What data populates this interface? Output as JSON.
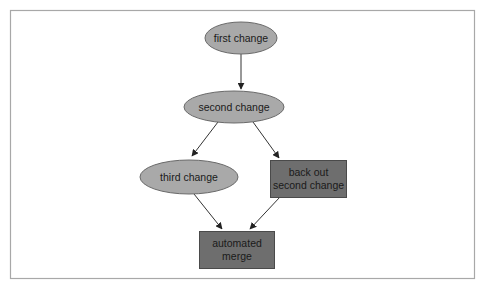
{
  "diagram": {
    "type": "flowchart",
    "colors": {
      "frame": "#a8a8a8",
      "ellipse_fill": "#a9a9a9",
      "ellipse_stroke": "#6a6a6a",
      "rect_fill": "#6e6e6e",
      "rect_stroke": "#4a4a4a",
      "edge": "#333333"
    },
    "nodes": [
      {
        "id": "first",
        "shape": "ellipse",
        "lines": [
          "first change"
        ]
      },
      {
        "id": "second",
        "shape": "ellipse",
        "lines": [
          "second change"
        ]
      },
      {
        "id": "third",
        "shape": "ellipse",
        "lines": [
          "third change"
        ]
      },
      {
        "id": "backout",
        "shape": "rect",
        "lines": [
          "back out",
          "second change"
        ]
      },
      {
        "id": "merge",
        "shape": "rect",
        "lines": [
          "automated",
          "merge"
        ]
      }
    ],
    "edges": [
      {
        "from": "first",
        "to": "second"
      },
      {
        "from": "second",
        "to": "third"
      },
      {
        "from": "second",
        "to": "backout"
      },
      {
        "from": "third",
        "to": "merge"
      },
      {
        "from": "backout",
        "to": "merge"
      }
    ]
  }
}
